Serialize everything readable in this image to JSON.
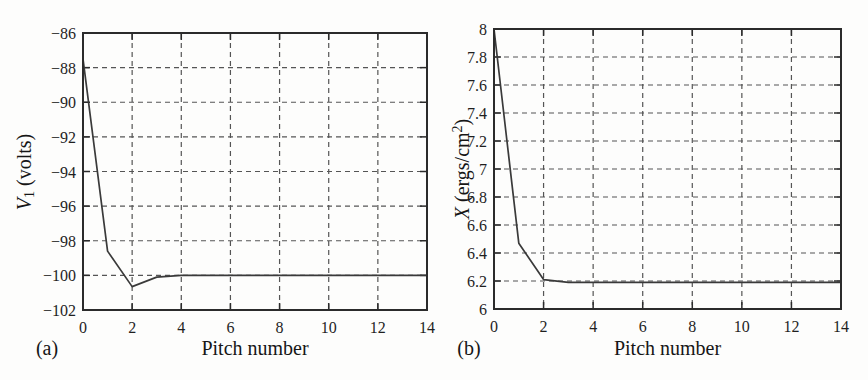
{
  "colors": {
    "background": "#fdfdfc",
    "line": "#3a3a3a",
    "grid": "#555555",
    "border": "#2b2b2b",
    "text": "#1f1f1f"
  },
  "chart_data": [
    {
      "type": "line",
      "panel_label": "(a)",
      "title": "",
      "xlabel": "Pitch number",
      "ylabel": "V1 (volts)",
      "ylabel_parts": [
        {
          "text": "V",
          "style": "italic"
        },
        {
          "text": "1",
          "style": "sub"
        },
        {
          "text": " (volts)",
          "style": "plain"
        }
      ],
      "x": [
        0,
        1,
        2,
        3,
        4,
        5,
        6,
        7,
        8,
        9,
        10,
        11,
        12,
        13,
        14
      ],
      "y": [
        -87.5,
        -98.6,
        -100.65,
        -100.1,
        -100,
        -100,
        -100,
        -100,
        -100,
        -100,
        -100,
        -100,
        -100,
        -100,
        -100
      ],
      "xlim": [
        0,
        14
      ],
      "ylim": [
        -102,
        -86
      ],
      "xticks": [
        0,
        2,
        4,
        6,
        8,
        10,
        12,
        14
      ],
      "xtick_labels": [
        "0",
        "2",
        "4",
        "6",
        "8",
        "10",
        "12",
        "14"
      ],
      "yticks": [
        -102,
        -100,
        -98,
        -96,
        -94,
        -92,
        -90,
        -88,
        -86
      ],
      "ytick_labels": [
        "−102",
        "−100",
        "−98",
        "−96",
        "−94",
        "−92",
        "−90",
        "−88",
        "−86"
      ],
      "grid": "dashed"
    },
    {
      "type": "line",
      "panel_label": "(b)",
      "title": "",
      "xlabel": "Pitch number",
      "ylabel": "X (ergs/cm2)",
      "ylabel_parts": [
        {
          "text": "X",
          "style": "italic"
        },
        {
          "text": " (ergs/cm",
          "style": "plain"
        },
        {
          "text": "2",
          "style": "sup"
        },
        {
          "text": ")",
          "style": "plain"
        }
      ],
      "x": [
        0,
        1,
        2,
        3,
        4,
        5,
        6,
        7,
        8,
        9,
        10,
        11,
        12,
        13,
        14
      ],
      "y": [
        8.0,
        6.47,
        6.21,
        6.19,
        6.19,
        6.19,
        6.19,
        6.19,
        6.19,
        6.19,
        6.19,
        6.19,
        6.19,
        6.19,
        6.19
      ],
      "xlim": [
        0,
        14
      ],
      "ylim": [
        6,
        8
      ],
      "xticks": [
        0,
        2,
        4,
        6,
        8,
        10,
        12,
        14
      ],
      "xtick_labels": [
        "0",
        "2",
        "4",
        "6",
        "8",
        "10",
        "12",
        "14"
      ],
      "yticks": [
        6,
        6.2,
        6.4,
        6.6,
        6.8,
        7,
        7.2,
        7.4,
        7.6,
        7.8,
        8
      ],
      "ytick_labels": [
        "6",
        "6.2",
        "6.4",
        "6.6",
        "6.8",
        "7",
        "7.2",
        "7.4",
        "7.6",
        "7.8",
        "8"
      ],
      "grid": "dashed"
    }
  ]
}
